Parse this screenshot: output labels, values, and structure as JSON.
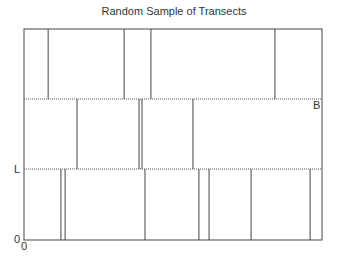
{
  "title": "Random Sample of Transects",
  "labels": {
    "B": "B",
    "L": "L",
    "origin_y": "0",
    "origin_x": "0"
  },
  "diagram": {
    "region_width_label": "B",
    "band_height_label": "L",
    "bands": [
      {
        "name": "bottom",
        "transect_fractions": [
          0.124,
          0.138,
          0.406,
          0.587,
          0.621,
          0.762,
          0.96
        ]
      },
      {
        "name": "middle",
        "transect_fractions": [
          0.178,
          0.386,
          0.396,
          0.567
        ]
      },
      {
        "name": "top",
        "transect_fractions": [
          0.081,
          0.336,
          0.426,
          0.842
        ]
      }
    ]
  },
  "colors": {
    "line": "#444444",
    "dotted": "#555555",
    "text": "#333333"
  }
}
